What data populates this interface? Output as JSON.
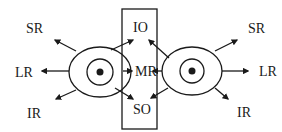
{
  "diagram": {
    "left_eye": {
      "labels": {
        "sr": "SR",
        "lr": "LR",
        "ir": "IR"
      }
    },
    "center_box": {
      "labels": {
        "io": "IO",
        "mr": "MR",
        "so": "SO"
      }
    },
    "right_eye": {
      "labels": {
        "sr": "SR",
        "lr": "LR",
        "ir": "IR"
      }
    },
    "colors": {
      "stroke": "#1a1a1a",
      "background": "#ffffff"
    }
  }
}
